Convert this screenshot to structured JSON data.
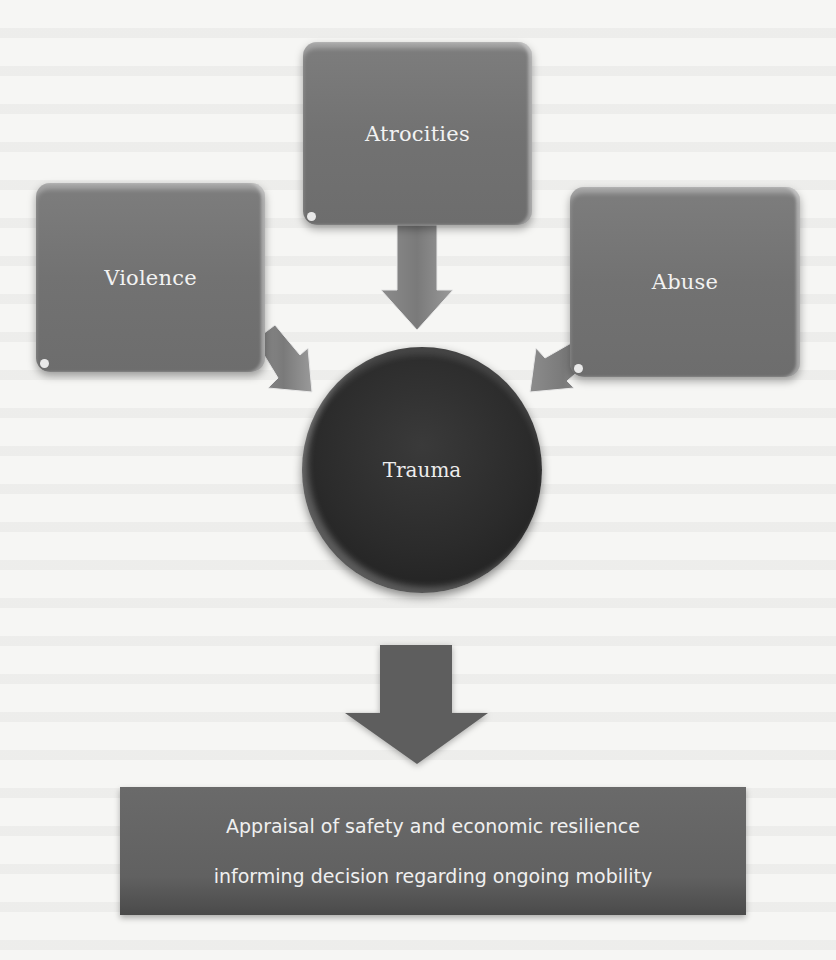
{
  "diagram": {
    "causes": [
      {
        "id": "atrocities",
        "label": "Atrocities"
      },
      {
        "id": "violence",
        "label": "Violence"
      },
      {
        "id": "abuse",
        "label": "Abuse"
      }
    ],
    "center": {
      "label": "Trauma"
    },
    "outcome": {
      "lines": [
        "Appraisal of safety and economic resilience",
        "informing decision regarding ongoing mobility"
      ]
    },
    "colors": {
      "box_fill": "#747474",
      "circle_fill": "#2b2b2b",
      "outcome_fill": "#626262",
      "arrow_fill": "#7a7a7a",
      "big_arrow_fill": "#5e5e5e",
      "label_text": "#f2f2f2"
    }
  }
}
